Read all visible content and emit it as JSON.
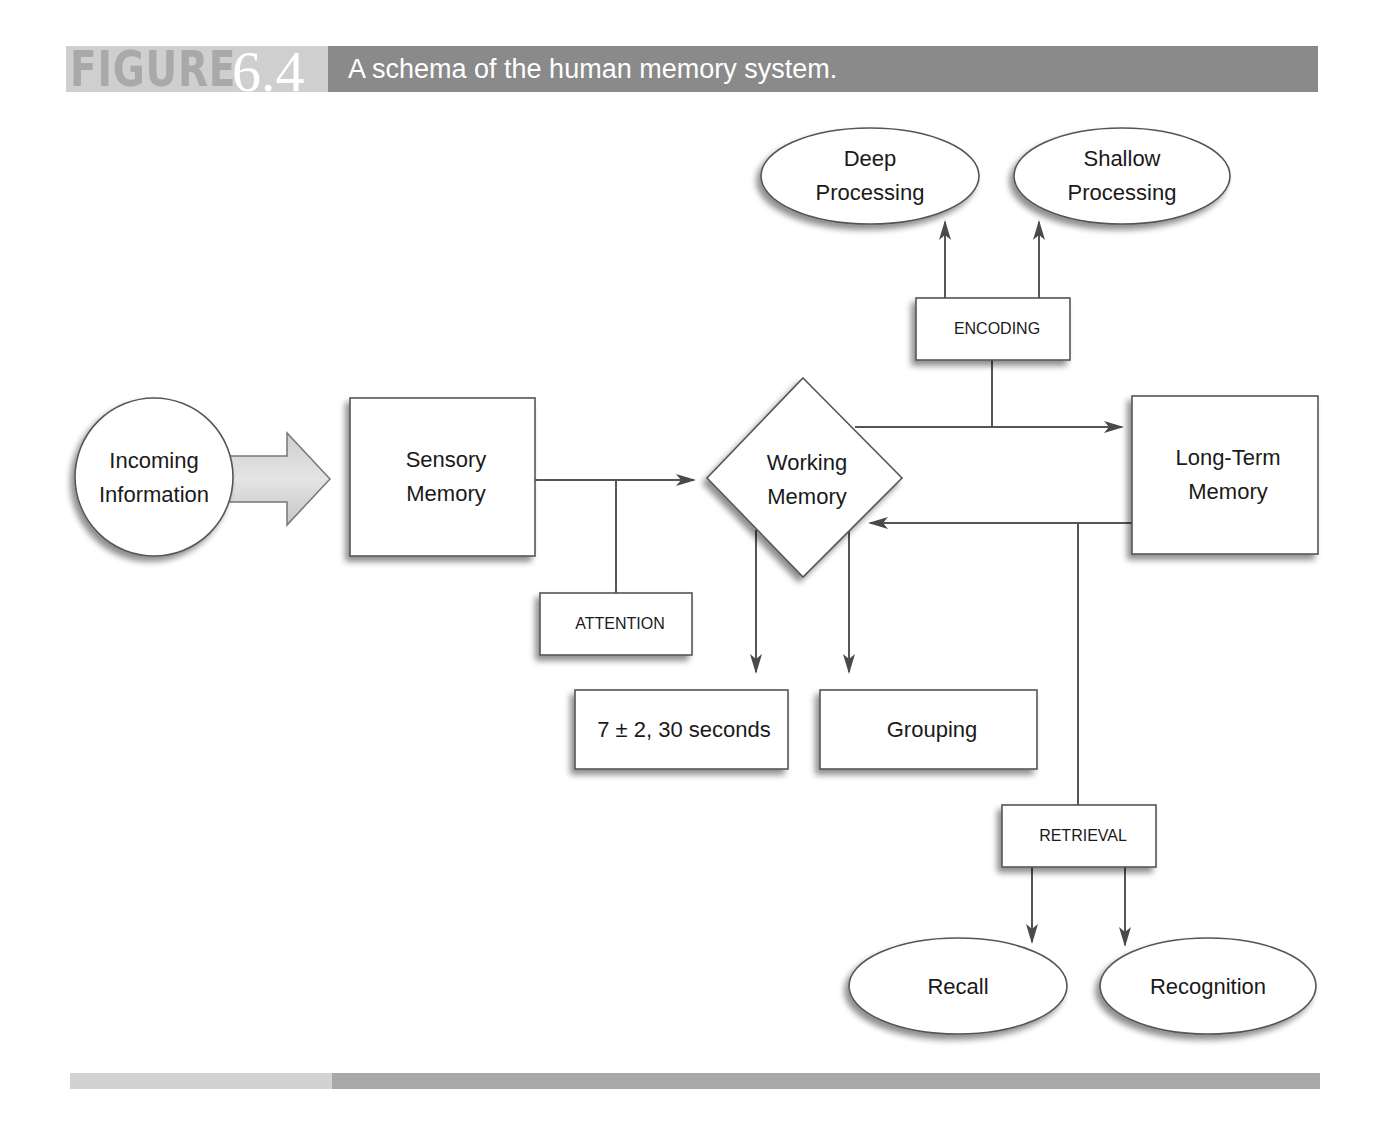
{
  "header": {
    "figure_word": "FIGURE",
    "figure_number": "6.4",
    "title": "A schema of the human memory system."
  },
  "nodes": {
    "incoming": {
      "line1": "Incoming",
      "line2": "Information",
      "shape": "circle"
    },
    "sensory": {
      "line1": "Sensory",
      "line2": "Memory",
      "shape": "rectangle"
    },
    "working": {
      "line1": "Working",
      "line2": "Memory",
      "shape": "diamond"
    },
    "long_term": {
      "line1": "Long-Term",
      "line2": "Memory",
      "shape": "rectangle"
    },
    "attention": {
      "label": "ATTENTION",
      "shape": "rectangle"
    },
    "encoding": {
      "label": "ENCODING",
      "shape": "rectangle"
    },
    "retrieval": {
      "label": "RETRIEVAL",
      "shape": "rectangle"
    },
    "capacity": {
      "label": "7 ± 2, 30 seconds",
      "shape": "rectangle"
    },
    "grouping": {
      "label": "Grouping",
      "shape": "rectangle"
    },
    "deep": {
      "line1": "Deep",
      "line2": "Processing",
      "shape": "ellipse"
    },
    "shallow": {
      "line1": "Shallow",
      "line2": "Processing",
      "shape": "ellipse"
    },
    "recall": {
      "label": "Recall",
      "shape": "ellipse"
    },
    "recognition": {
      "label": "Recognition",
      "shape": "ellipse"
    }
  },
  "edges": [
    {
      "from": "Incoming Information",
      "to": "Sensory Memory",
      "style": "block-arrow"
    },
    {
      "from": "Sensory Memory",
      "to": "Working Memory",
      "via": "ATTENTION"
    },
    {
      "from": "Working Memory",
      "to": "Long-Term Memory",
      "via": "ENCODING"
    },
    {
      "from": "ENCODING",
      "to": "Deep Processing"
    },
    {
      "from": "ENCODING",
      "to": "Shallow Processing"
    },
    {
      "from": "Long-Term Memory",
      "to": "Working Memory",
      "via": "RETRIEVAL"
    },
    {
      "from": "RETRIEVAL",
      "to": "Recall"
    },
    {
      "from": "RETRIEVAL",
      "to": "Recognition"
    },
    {
      "from": "Working Memory",
      "to": "7 ± 2, 30 seconds"
    },
    {
      "from": "Working Memory",
      "to": "Grouping"
    }
  ],
  "colors": {
    "header_dark": "#8a8a8a",
    "header_light": "#cfcfcf",
    "line": "#555555",
    "shape_fill": "#ffffff",
    "shadow": "#9a9a9a"
  }
}
